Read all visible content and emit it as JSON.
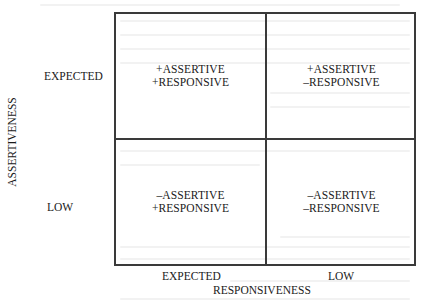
{
  "diagram": {
    "type": "2x2 matrix",
    "y_axis": {
      "title": "ASSERTIVENESS",
      "levels": [
        "EXPECTED",
        "LOW"
      ]
    },
    "x_axis": {
      "title": "RESPONSIVENESS",
      "levels": [
        "EXPECTED",
        "LOW"
      ]
    },
    "quadrants": [
      {
        "position": "top-left",
        "line1": "+ASSERTIVE",
        "line2": "+RESPONSIVE"
      },
      {
        "position": "top-right",
        "line1": "+ASSERTIVE",
        "line2": "–RESPONSIVE"
      },
      {
        "position": "bottom-left",
        "line1": "–ASSERTIVE",
        "line2": "+RESPONSIVE"
      },
      {
        "position": "bottom-right",
        "line1": "–ASSERTIVE",
        "line2": "–RESPONSIVE"
      }
    ]
  },
  "colors": {
    "line": "#3a3a3a",
    "text": "#1a1a1a",
    "background": "#ffffff",
    "bleed_through": "#f2f2f2"
  }
}
